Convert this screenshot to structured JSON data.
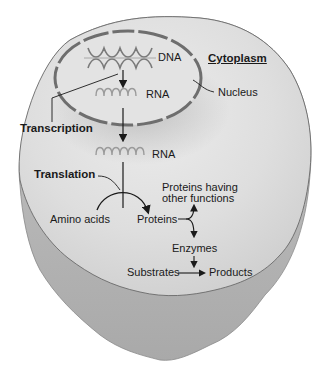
{
  "diagram": {
    "labels": {
      "cytoplasm": "Cytoplasm",
      "nucleus": "Nucleus",
      "dna": "DNA",
      "rna_nuclear": "RNA",
      "rna_cytoplasmic": "RNA",
      "transcription": "Transcription",
      "translation": "Translation",
      "amino_acids": "Amino acids",
      "proteins": "Proteins",
      "proteins_other_line1": "Proteins having",
      "proteins_other_line2": "other functions",
      "enzymes": "Enzymes",
      "substrates": "Substrates",
      "products": "Products"
    },
    "colors": {
      "cell_fill": "#d4d4d4",
      "cell_top": "#e6e6e6",
      "cell_side": "#b8b8b8",
      "outline": "#6a6a6a",
      "helix": "#8a8a8a",
      "text": "#1a1a1a"
    }
  }
}
